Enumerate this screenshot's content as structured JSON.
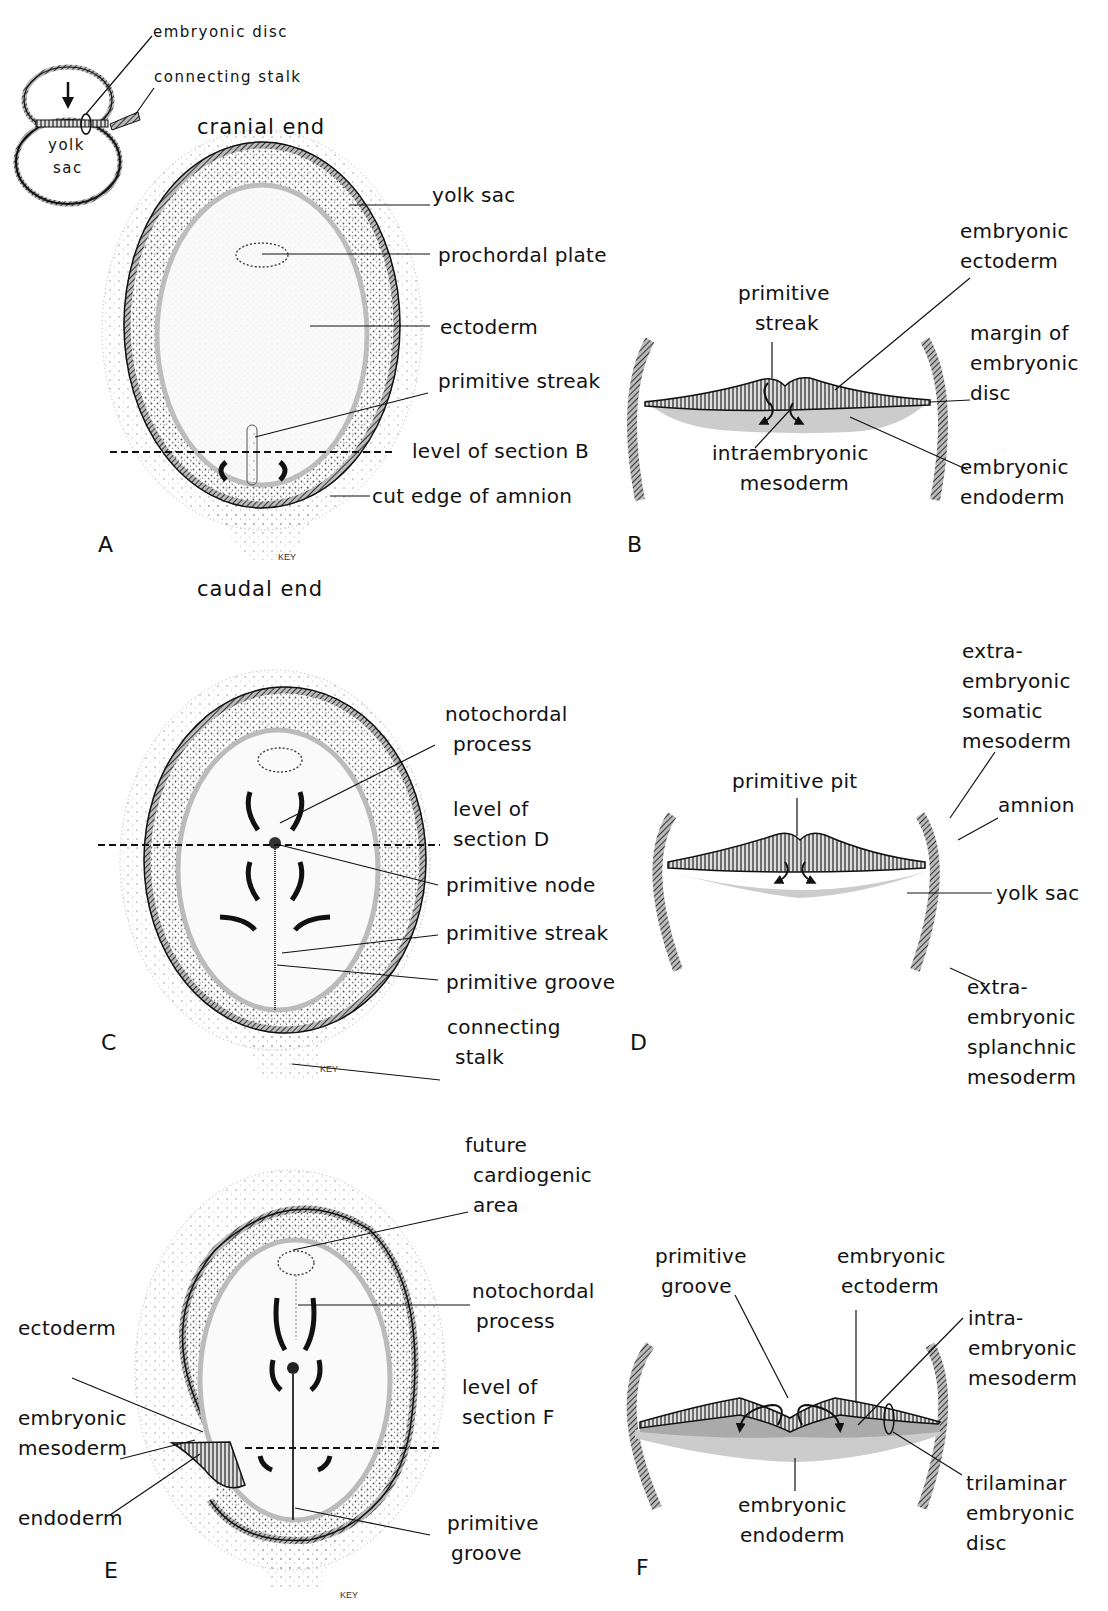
{
  "inset": {
    "labels": {
      "embryonic_disc": "embryonic disc",
      "connecting_stalk": "connecting stalk",
      "yolk": "yolk",
      "sac": "sac"
    }
  },
  "panel_a": {
    "letter": "A",
    "cranial_end": "cranial end",
    "caudal_end": "caudal end",
    "labels": {
      "yolk_sac": "yolk sac",
      "prochordal_plate": "prochordal plate",
      "ectoderm": "ectoderm",
      "primitive_streak": "primitive streak",
      "level_section": "level of section B",
      "cut_edge": "cut edge of amnion"
    },
    "signature": "KEY"
  },
  "panel_b": {
    "letter": "B",
    "labels": {
      "primitive_streak_1": "primitive",
      "primitive_streak_2": "streak",
      "emb_ectoderm_1": "embryonic",
      "emb_ectoderm_2": "ectoderm",
      "margin_1": "margin of",
      "margin_2": "embryonic",
      "margin_3": "disc",
      "intra_1": "intraembryonic",
      "intra_2": "mesoderm",
      "emb_endoderm_1": "embryonic",
      "emb_endoderm_2": "endoderm"
    }
  },
  "panel_c": {
    "letter": "C",
    "labels": {
      "notochordal_1": "notochordal",
      "notochordal_2": "process",
      "level_1": "level of",
      "level_2": "section D",
      "primitive_node": "primitive node",
      "primitive_streak": "primitive streak",
      "primitive_groove": "primitive groove",
      "connecting_1": "connecting",
      "connecting_2": "stalk"
    },
    "signature": "KEY"
  },
  "panel_d": {
    "letter": "D",
    "labels": {
      "somatic_1": "extra-",
      "somatic_2": "embryonic",
      "somatic_3": "somatic",
      "somatic_4": "mesoderm",
      "primitive_pit": "primitive pit",
      "amnion": "amnion",
      "yolk_sac": "yolk sac",
      "splanchnic_1": "extra-",
      "splanchnic_2": "embryonic",
      "splanchnic_3": "splanchnic",
      "splanchnic_4": "mesoderm"
    }
  },
  "panel_e": {
    "letter": "E",
    "labels": {
      "future_1": "future",
      "future_2": "cardiogenic",
      "future_3": "area",
      "notochordal_1": "notochordal",
      "notochordal_2": "process",
      "ectoderm": "ectoderm",
      "level_1": "level of",
      "level_2": "section F",
      "emb_meso_1": "embryonic",
      "emb_meso_2": "mesoderm",
      "endoderm": "endoderm",
      "groove_1": "primitive",
      "groove_2": "groove"
    },
    "signature": "KEY"
  },
  "panel_f": {
    "letter": "F",
    "labels": {
      "groove_1": "primitive",
      "groove_2": "groove",
      "ecto_1": "embryonic",
      "ecto_2": "ectoderm",
      "intra_1": "intra-",
      "intra_2": "embryonic",
      "intra_3": "mesoderm",
      "endo_1": "embryonic",
      "endo_2": "endoderm",
      "tri_1": "trilaminar",
      "tri_2": "embryonic",
      "tri_3": "disc"
    }
  },
  "colors": {
    "ink": "#111111",
    "hatch": "#555555",
    "stipple": "#9a9a9a",
    "light_gray": "#c8c8c8",
    "background": "#ffffff"
  }
}
